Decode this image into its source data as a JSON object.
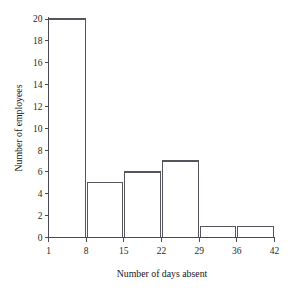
{
  "chart_data": {
    "type": "bar",
    "title": "",
    "xlabel": "Number of days absent",
    "ylabel": "Number of employees",
    "categories": [
      "1-8",
      "8-15",
      "15-22",
      "22-29",
      "29-36",
      "36-42"
    ],
    "bin_edges": [
      1,
      8,
      15,
      22,
      29,
      36,
      42
    ],
    "values": [
      20,
      5,
      6,
      7,
      1,
      1
    ],
    "x_tick_labels": [
      "1",
      "8",
      "15",
      "22",
      "29",
      "36",
      "42"
    ],
    "y_tick_labels": [
      "0",
      "2",
      "4",
      "6",
      "8",
      "10",
      "12",
      "14",
      "16",
      "18",
      "20"
    ],
    "y_tick_values": [
      0,
      2,
      4,
      6,
      8,
      10,
      12,
      14,
      16,
      18,
      20
    ],
    "xlim": [
      1,
      42
    ],
    "ylim": [
      0,
      20
    ],
    "grid": false,
    "legend": false,
    "bar_style": "outline",
    "colors": {
      "bar_stroke": "#55555d",
      "axis": "#4a4a52",
      "text": "#1f1f24",
      "background": "#ffffff"
    }
  }
}
